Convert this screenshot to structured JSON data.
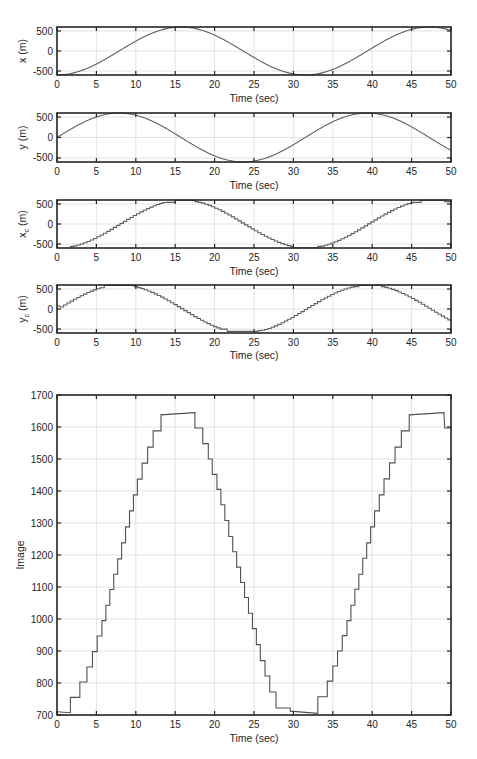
{
  "chart_data": [
    {
      "type": "line",
      "id": "x",
      "title": "",
      "xlabel": "Time (sec)",
      "ylabel": "x (m)",
      "xlim": [
        0,
        50
      ],
      "ylim": [
        -600,
        600
      ],
      "xticks": [
        0,
        5,
        10,
        15,
        20,
        25,
        30,
        35,
        40,
        45,
        50
      ],
      "yticks": [
        -500,
        0,
        500
      ],
      "grid": true,
      "series": [
        {
          "name": "x",
          "color": "#606060",
          "function": "-600*cos(2*pi*t/31.5)",
          "x": [
            0,
            5,
            10,
            15,
            16,
            20,
            25,
            30,
            32,
            35,
            40,
            45,
            47,
            50
          ],
          "y": [
            -590,
            -320,
            250,
            590,
            600,
            400,
            -200,
            -590,
            -600,
            -430,
            120,
            590,
            600,
            520
          ]
        }
      ]
    },
    {
      "type": "line",
      "id": "y",
      "title": "",
      "xlabel": "Time (sec)",
      "ylabel": "y (m)",
      "xlim": [
        0,
        50
      ],
      "ylim": [
        -600,
        600
      ],
      "xticks": [
        0,
        5,
        10,
        15,
        20,
        25,
        30,
        35,
        40,
        45,
        50
      ],
      "yticks": [
        -500,
        0,
        500
      ],
      "grid": true,
      "series": [
        {
          "name": "y",
          "color": "#606060",
          "function": "600*sin(2*pi*t/31.5)",
          "x": [
            0,
            5,
            8,
            10,
            15,
            20,
            24,
            25,
            30,
            35,
            40,
            45,
            50
          ],
          "y": [
            0,
            500,
            600,
            560,
            50,
            -510,
            -600,
            -590,
            -180,
            400,
            600,
            420,
            -330
          ]
        }
      ]
    },
    {
      "type": "line",
      "id": "x_c",
      "title": "",
      "xlabel": "Time (sec)",
      "ylabel": "x_c (m)",
      "xlim": [
        0,
        50
      ],
      "ylim": [
        -600,
        600
      ],
      "xticks": [
        0,
        5,
        10,
        15,
        20,
        25,
        30,
        35,
        40,
        45,
        50
      ],
      "yticks": [
        -500,
        0,
        500
      ],
      "grid": true,
      "step": true,
      "series": [
        {
          "name": "x_c",
          "color": "#606060",
          "x": [
            1.7,
            2.9,
            14.1,
            15.0,
            17.5,
            29.0,
            30.0,
            33.1,
            34.3,
            45.3,
            49.2,
            50
          ],
          "y": [
            -590,
            -560,
            520,
            580,
            560,
            -560,
            -590,
            -590,
            -560,
            540,
            560,
            540
          ]
        }
      ]
    },
    {
      "type": "line",
      "id": "y_c",
      "title": "",
      "xlabel": "Time (sec)",
      "ylabel": "y_c (m)",
      "xlim": [
        0,
        50
      ],
      "ylim": [
        -600,
        600
      ],
      "xticks": [
        0,
        5,
        10,
        15,
        20,
        25,
        30,
        35,
        40,
        45,
        50
      ],
      "yticks": [
        -500,
        0,
        500
      ],
      "grid": true,
      "step": true,
      "series": [
        {
          "name": "y_c",
          "color": "#606060",
          "x": [
            0,
            5.0,
            6.0,
            9.8,
            10.6,
            20.5,
            21.6,
            25.5,
            26.5,
            37.6,
            41.2,
            50
          ],
          "y": [
            60,
            540,
            590,
            590,
            550,
            -510,
            -560,
            -560,
            -520,
            580,
            590,
            -330
          ]
        }
      ]
    },
    {
      "type": "line",
      "id": "image",
      "title": "",
      "xlabel": "Time (sec)",
      "ylabel": "Image",
      "xlim": [
        0,
        50
      ],
      "ylim": [
        700,
        1700
      ],
      "xticks": [
        0,
        5,
        10,
        15,
        20,
        25,
        30,
        35,
        40,
        45,
        50
      ],
      "yticks": [
        700,
        800,
        900,
        1000,
        1100,
        1200,
        1300,
        1400,
        1500,
        1600,
        1700
      ],
      "grid": true,
      "step": true,
      "series": [
        {
          "name": "Image",
          "color": "#505050",
          "points": [
            [
              0,
              710
            ],
            [
              1.7,
              707
            ],
            [
              1.7,
              755
            ],
            [
              2.9,
              755
            ],
            [
              2.9,
              803
            ],
            [
              3.8,
              803
            ],
            [
              3.8,
              850
            ],
            [
              4.5,
              850
            ],
            [
              4.5,
              898
            ],
            [
              5.1,
              898
            ],
            [
              5.1,
              947
            ],
            [
              5.7,
              947
            ],
            [
              5.7,
              995
            ],
            [
              6.2,
              995
            ],
            [
              6.2,
              1043
            ],
            [
              6.7,
              1043
            ],
            [
              6.7,
              1092
            ],
            [
              7.2,
              1092
            ],
            [
              7.2,
              1140
            ],
            [
              7.7,
              1140
            ],
            [
              7.7,
              1188
            ],
            [
              8.2,
              1188
            ],
            [
              8.2,
              1238
            ],
            [
              8.7,
              1238
            ],
            [
              8.7,
              1288
            ],
            [
              9.2,
              1288
            ],
            [
              9.2,
              1338
            ],
            [
              9.7,
              1338
            ],
            [
              9.7,
              1388
            ],
            [
              10.2,
              1388
            ],
            [
              10.2,
              1437
            ],
            [
              10.8,
              1437
            ],
            [
              10.8,
              1487
            ],
            [
              11.5,
              1487
            ],
            [
              11.5,
              1537
            ],
            [
              12.2,
              1537
            ],
            [
              12.2,
              1588
            ],
            [
              13.2,
              1588
            ],
            [
              13.2,
              1638
            ],
            [
              17.5,
              1645
            ],
            [
              17.5,
              1597
            ],
            [
              18.5,
              1597
            ],
            [
              18.5,
              1548
            ],
            [
              19.2,
              1548
            ],
            [
              19.2,
              1500
            ],
            [
              19.7,
              1500
            ],
            [
              19.7,
              1452
            ],
            [
              20.3,
              1452
            ],
            [
              20.3,
              1405
            ],
            [
              20.8,
              1405
            ],
            [
              20.8,
              1357
            ],
            [
              21.3,
              1357
            ],
            [
              21.3,
              1308
            ],
            [
              21.8,
              1308
            ],
            [
              21.8,
              1258
            ],
            [
              22.3,
              1258
            ],
            [
              22.3,
              1210
            ],
            [
              22.8,
              1210
            ],
            [
              22.8,
              1162
            ],
            [
              23.3,
              1162
            ],
            [
              23.3,
              1114
            ],
            [
              23.8,
              1114
            ],
            [
              23.8,
              1067
            ],
            [
              24.3,
              1067
            ],
            [
              24.3,
              1018
            ],
            [
              24.8,
              1018
            ],
            [
              24.8,
              970
            ],
            [
              25.3,
              970
            ],
            [
              25.3,
              920
            ],
            [
              25.8,
              920
            ],
            [
              25.8,
              870
            ],
            [
              26.4,
              870
            ],
            [
              26.4,
              822
            ],
            [
              27.0,
              822
            ],
            [
              27.0,
              772
            ],
            [
              27.8,
              772
            ],
            [
              27.8,
              722
            ],
            [
              29.6,
              722
            ],
            [
              29.6,
              712
            ],
            [
              33.1,
              705
            ],
            [
              33.1,
              757
            ],
            [
              34.3,
              757
            ],
            [
              34.3,
              806
            ],
            [
              35.0,
              806
            ],
            [
              35.0,
              853
            ],
            [
              35.6,
              853
            ],
            [
              35.6,
              900
            ],
            [
              36.2,
              900
            ],
            [
              36.2,
              948
            ],
            [
              36.8,
              948
            ],
            [
              36.8,
              995
            ],
            [
              37.3,
              995
            ],
            [
              37.3,
              1043
            ],
            [
              37.8,
              1043
            ],
            [
              37.8,
              1093
            ],
            [
              38.3,
              1093
            ],
            [
              38.3,
              1140
            ],
            [
              38.8,
              1140
            ],
            [
              38.8,
              1190
            ],
            [
              39.3,
              1190
            ],
            [
              39.3,
              1238
            ],
            [
              39.8,
              1238
            ],
            [
              39.8,
              1288
            ],
            [
              40.3,
              1288
            ],
            [
              40.3,
              1338
            ],
            [
              40.9,
              1338
            ],
            [
              40.9,
              1388
            ],
            [
              41.5,
              1388
            ],
            [
              41.5,
              1438
            ],
            [
              42.2,
              1438
            ],
            [
              42.2,
              1488
            ],
            [
              42.9,
              1488
            ],
            [
              42.9,
              1537
            ],
            [
              43.7,
              1537
            ],
            [
              43.7,
              1588
            ],
            [
              44.7,
              1588
            ],
            [
              44.7,
              1638
            ],
            [
              49.1,
              1645
            ],
            [
              49.2,
              1597
            ],
            [
              50,
              1597
            ]
          ]
        }
      ]
    }
  ],
  "labels": {
    "xlabel": "Time (sec)",
    "ylabel_x": "x (m)",
    "ylabel_y": "y (m)",
    "ylabel_xc_main": "x",
    "ylabel_xc_sub": "c",
    "ylabel_xc_unit": " (m)",
    "ylabel_yc_main": "y",
    "ylabel_yc_sub": "c",
    "ylabel_yc_unit": " (m)",
    "ylabel_image": "Image"
  }
}
